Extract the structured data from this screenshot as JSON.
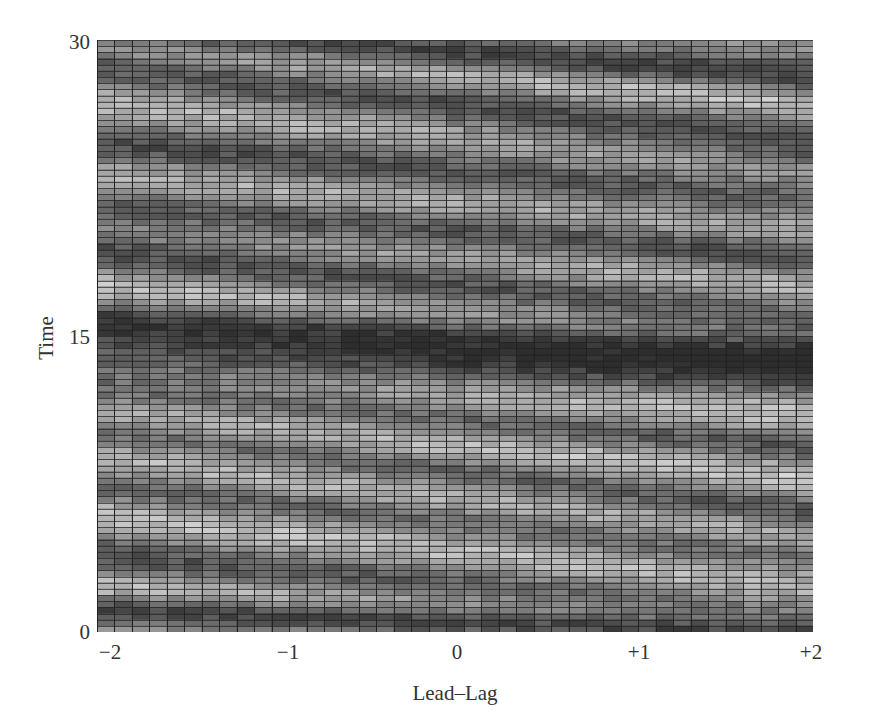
{
  "chart_data": {
    "type": "heatmap",
    "title": "",
    "xlabel": "Lead–Lag",
    "ylabel": "Time",
    "x_ticks": [
      "−2",
      "−1",
      "0",
      "+1",
      "+2"
    ],
    "x_tick_values": [
      -2,
      -1,
      0,
      1,
      2
    ],
    "y_ticks": [
      "0",
      "15",
      "30"
    ],
    "y_tick_values": [
      0,
      15,
      30
    ],
    "xlim": [
      -2,
      2
    ],
    "ylim": [
      0,
      30
    ],
    "grid": true,
    "colormap": "grayscale (dark = low, light = high)",
    "legend": null,
    "n_columns": 41,
    "n_rows": 96,
    "value_range": [
      0,
      1
    ],
    "band_model_note": "Approximate diagonal bands read from image; time position at lead-lag 0, slope in time-units per lead-lag unit (negative = descending to the right).",
    "dark_bands": [
      {
        "t0": 29.3,
        "slope": -0.6,
        "width": 0.6
      },
      {
        "t0": 26.6,
        "slope": -1.0,
        "width": 0.9
      },
      {
        "t0": 23.4,
        "slope": -0.7,
        "width": 1.0
      },
      {
        "t0": 20.3,
        "slope": -0.6,
        "width": 0.8
      },
      {
        "t0": 17.6,
        "slope": -0.9,
        "width": 0.9
      },
      {
        "t0": 15.0,
        "slope": -0.4,
        "width": 0.8
      },
      {
        "t0": 13.4,
        "slope": -0.2,
        "width": 0.9
      },
      {
        "t0": 10.8,
        "slope": -0.7,
        "width": 0.7
      },
      {
        "t0": 8.1,
        "slope": -1.0,
        "width": 0.7
      },
      {
        "t0": 5.6,
        "slope": -0.9,
        "width": 0.7
      },
      {
        "t0": 2.4,
        "slope": -0.8,
        "width": 0.9
      },
      {
        "t0": 0.6,
        "slope": -0.3,
        "width": 0.5
      }
    ],
    "light_bands": [
      {
        "t0": 28.2,
        "slope": -0.7,
        "width": 0.6
      },
      {
        "t0": 25.0,
        "slope": -0.9,
        "width": 1.0
      },
      {
        "t0": 21.8,
        "slope": -0.7,
        "width": 0.8
      },
      {
        "t0": 19.0,
        "slope": -0.8,
        "width": 0.8
      },
      {
        "t0": 16.3,
        "slope": -0.6,
        "width": 0.7
      },
      {
        "t0": 12.0,
        "slope": -0.5,
        "width": 1.0
      },
      {
        "t0": 9.4,
        "slope": -0.8,
        "width": 0.8
      },
      {
        "t0": 6.8,
        "slope": -1.0,
        "width": 0.9
      },
      {
        "t0": 4.0,
        "slope": -0.9,
        "width": 1.1
      },
      {
        "t0": 1.4,
        "slope": -0.5,
        "width": 0.6
      }
    ]
  },
  "style": {
    "grid_line_color": "#222222",
    "dark_cell_color": "#3a3a3a",
    "light_cell_color": "#d8d8d8",
    "axis_text_color": "#333333"
  }
}
